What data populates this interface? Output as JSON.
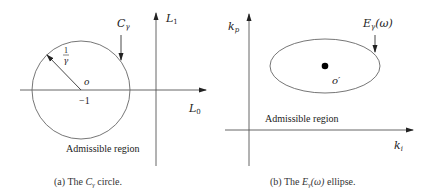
{
  "panel_a": {
    "caption_prefix": "(a)  The ",
    "caption_symbol": "C",
    "caption_sub": "γ",
    "caption_suffix": " circle.",
    "curve_label": "C",
    "curve_label_sub": "γ",
    "radius_num": "1",
    "radius_den": "γ",
    "center_label": "o",
    "center_value": "−1",
    "axis_x_label": "L",
    "axis_x_sub": "0",
    "axis_y_label": "L",
    "axis_y_sub": "1",
    "region_label": "Admissible region"
  },
  "panel_b": {
    "caption_prefix": "(b)  The ",
    "caption_symbol": "E",
    "caption_sub": "γ",
    "caption_arg": "(ω)",
    "caption_suffix": " ellipse.",
    "curve_label": "E",
    "curve_label_sub": "γ",
    "curve_label_arg": "(ω)",
    "center_label": "o′",
    "axis_x_label": "k",
    "axis_x_sub": "i",
    "axis_y_label": "k",
    "axis_y_sub": "p",
    "region_label": "Admissible region"
  },
  "colors": {
    "line": "#555555",
    "text": "#222222",
    "dot": "#000000"
  }
}
